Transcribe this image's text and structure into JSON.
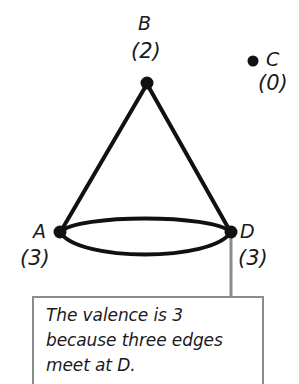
{
  "figure": {
    "type": "cone-graph-diagram",
    "vertices": [
      {
        "id": "B",
        "name": "B",
        "valence": "(2)",
        "valence_number": 2,
        "x": 147,
        "y": 83,
        "isolated": false
      },
      {
        "id": "C",
        "name": "C",
        "valence": "(0)",
        "valence_number": 0,
        "x": 253,
        "y": 61,
        "isolated": true
      },
      {
        "id": "A",
        "name": "A",
        "valence": "(3)",
        "valence_number": 3,
        "x": 60,
        "y": 232,
        "isolated": false
      },
      {
        "id": "D",
        "name": "D",
        "valence": "(3)",
        "valence_number": 3,
        "x": 231,
        "y": 232,
        "isolated": false
      }
    ],
    "edges": [
      {
        "from": "B",
        "to": "A",
        "kind": "straight"
      },
      {
        "from": "B",
        "to": "D",
        "kind": "straight"
      },
      {
        "from": "A",
        "to": "D",
        "kind": "arc-upper"
      },
      {
        "from": "A",
        "to": "D",
        "kind": "arc-lower"
      }
    ],
    "colors": {
      "ink": "#111111",
      "leader": "#8c8c8c",
      "box_border": "#8c8c8c",
      "background": "#ffffff"
    }
  },
  "callout": {
    "lines": [
      "The valence is 3",
      "because three edges",
      "meet at D."
    ],
    "line1": "The valence is 3",
    "line2": "because three edges",
    "line3": "meet at D.",
    "leader_from": "D"
  }
}
